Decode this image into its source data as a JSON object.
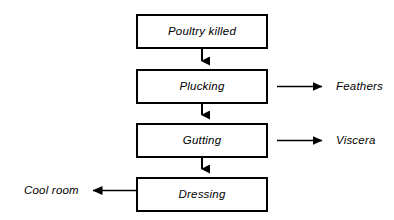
{
  "diagram": {
    "type": "flowchart",
    "background_color": "#ffffff",
    "line_color": "#000000",
    "text_color": "#000000",
    "process_steps": [
      {
        "id": "poultry-killed",
        "label": "Poultry killed",
        "order": 1
      },
      {
        "id": "plucking",
        "label": "Plucking",
        "order": 2
      },
      {
        "id": "gutting",
        "label": "Gutting",
        "order": 3
      },
      {
        "id": "dressing",
        "label": "Dressing",
        "order": 4
      }
    ],
    "outputs": [
      {
        "id": "feathers",
        "label": "Feathers",
        "from": "plucking",
        "direction": "right"
      },
      {
        "id": "viscera",
        "label": "Viscera",
        "from": "gutting",
        "direction": "right"
      },
      {
        "id": "cool-room",
        "label": "Cool room",
        "from": "dressing",
        "direction": "left"
      }
    ],
    "connectors": [
      {
        "from": "poultry-killed",
        "to": "plucking",
        "direction": "down"
      },
      {
        "from": "plucking",
        "to": "gutting",
        "direction": "down"
      },
      {
        "from": "gutting",
        "to": "dressing",
        "direction": "down"
      }
    ]
  }
}
